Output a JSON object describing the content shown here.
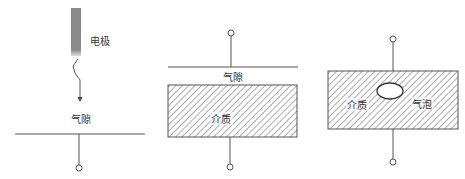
{
  "diagram": {
    "title": "",
    "colors": {
      "line": "#555555",
      "electrode": "#8a8a8a",
      "hatch": "#6a6a6a",
      "background": "#ffffff",
      "text": "#333333"
    },
    "panels": [
      {
        "id": "needle-plate-air-gap",
        "labels": {
          "electrode": "电极",
          "gap": "气隙"
        }
      },
      {
        "id": "plate-air-gap-dielectric",
        "labels": {
          "gap": "气隙",
          "dielectric": "介质"
        }
      },
      {
        "id": "dielectric-with-bubble",
        "labels": {
          "dielectric": "介质",
          "bubble": "气泡"
        }
      }
    ]
  }
}
